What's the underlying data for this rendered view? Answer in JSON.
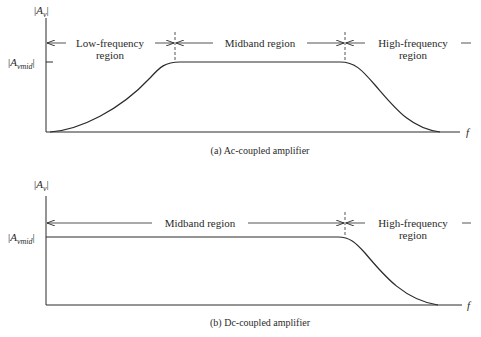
{
  "panels": [
    {
      "id": "a",
      "caption": "(a) Ac-coupled amplifier",
      "y_label_main": "A",
      "y_label_sub": "v",
      "mid_label_main": "A",
      "mid_label_sub": "vmid",
      "x_label": "f",
      "regions": [
        {
          "label_line1": "Low-frequency",
          "label_line2": "region"
        },
        {
          "label_line1": "Midband region",
          "label_line2": ""
        },
        {
          "label_line1": "High-frequency",
          "label_line2": "region"
        }
      ],
      "response": "rises at low frequency, flat in midband, falls at high frequency"
    },
    {
      "id": "b",
      "caption": "(b) Dc-coupled amplifier",
      "y_label_main": "A",
      "y_label_sub": "v",
      "mid_label_main": "A",
      "mid_label_sub": "vmid",
      "x_label": "f",
      "regions": [
        {
          "label_line1": "Midband region",
          "label_line2": ""
        },
        {
          "label_line1": "High-frequency",
          "label_line2": "region"
        }
      ],
      "response": "flat from dc through midband, falls at high frequency"
    }
  ],
  "colors": {
    "ink": "#2a2a2a",
    "background": "#ffffff"
  }
}
